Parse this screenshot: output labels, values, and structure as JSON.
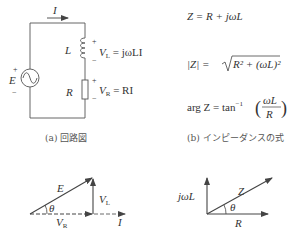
{
  "circuit": {
    "current_label": "I",
    "source_label": "E",
    "source_plus": "+",
    "source_minus": "−",
    "inductor_label": "L",
    "resistor_label": "R",
    "vl_plus": "+",
    "vl_minus": "−",
    "vr_plus": "+",
    "vr_minus": "−",
    "vl_eq": {
      "sym": "V",
      "sub": "L",
      "rhs": " = jωLI"
    },
    "vr_eq": {
      "sym": "V",
      "sub": "R",
      "rhs": " = RI"
    },
    "caption": "(a) 回路図"
  },
  "formulas": {
    "z_def": "Z = R + jωL",
    "z_mag_lhs": "|Z| = ",
    "z_mag_rhs": "R² + (ωL)²",
    "arg_lhs": "arg Z = tan",
    "arg_exp": "−1",
    "arg_num": "ωL",
    "arg_den": "R",
    "caption": "(b) インピーダンスの式"
  },
  "phasor_voltage": {
    "e_label": "E",
    "theta_label": "θ",
    "vl_sym": "V",
    "vl_sub": "L",
    "vr_sym": "V",
    "vr_sub": "R",
    "i_label": "I"
  },
  "phasor_impedance": {
    "z_label": "Z",
    "theta_label": "θ",
    "jwl_label": "jωL",
    "r_label": "R"
  },
  "colors": {
    "line": "#444444",
    "text": "#333333",
    "caption": "#555555"
  }
}
